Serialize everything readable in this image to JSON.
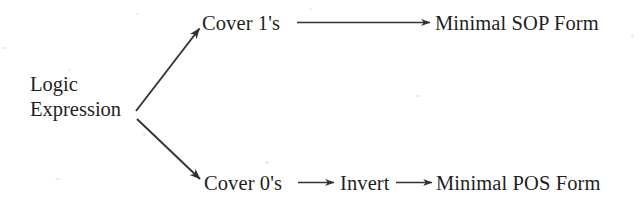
{
  "diagram": {
    "background_color": "#ffffff",
    "ink_color": "#1f1f1f",
    "nodes": {
      "source": {
        "line1": "Logic",
        "line2": "Expression"
      },
      "cover_ones": "Cover 1's",
      "cover_zeros": "Cover 0's",
      "invert": "Invert",
      "minimal_sop": "Minimal SOP Form",
      "minimal_pos": "Minimal POS Form"
    },
    "edges": [
      {
        "name": "source-to-cover-ones",
        "from": "Logic Expression",
        "to": "Cover 1's",
        "style": "diagonal-up",
        "arrowhead": "end"
      },
      {
        "name": "source-to-cover-zeros",
        "from": "Logic Expression",
        "to": "Cover 0's",
        "style": "diagonal-down",
        "arrowhead": "end"
      },
      {
        "name": "cover-ones-to-minimal-sop",
        "from": "Cover 1's",
        "to": "Minimal SOP Form",
        "style": "horizontal-long",
        "arrowhead": "end"
      },
      {
        "name": "cover-zeros-to-invert",
        "from": "Cover 0's",
        "to": "Invert",
        "style": "horizontal-short",
        "arrowhead": "end"
      },
      {
        "name": "invert-to-minimal-pos",
        "from": "Invert",
        "to": "Minimal POS Form",
        "style": "horizontal-short",
        "arrowhead": "end"
      }
    ]
  }
}
